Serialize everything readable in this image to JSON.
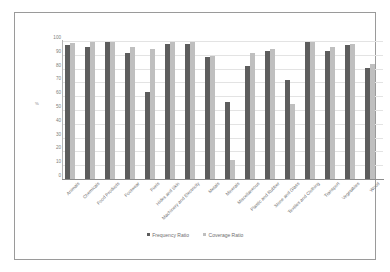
{
  "chart_data": {
    "type": "bar",
    "title": "",
    "xlabel": "",
    "ylabel": "%",
    "ylim": [
      0,
      100
    ],
    "yticks": [
      100,
      90,
      80,
      70,
      60,
      50,
      40,
      30,
      20,
      10,
      0
    ],
    "grid": true,
    "legend_position": "bottom",
    "categories": [
      "Animals",
      "Chemicals",
      "Food Products",
      "Footwear",
      "Fuels",
      "Hides and Skin",
      "Machinery and Electricity",
      "Metals",
      "Minerals",
      "Miscellaneous",
      "Plastic and Rubber",
      "Stone and Glass",
      "Textiles and Clothing",
      "Transport",
      "Vegetables",
      "Wood"
    ],
    "series": [
      {
        "name": "Frequency Ratio",
        "color": "#5d5d5d",
        "values": [
          97,
          96,
          99,
          91,
          63,
          98,
          98,
          88.5,
          56,
          82,
          93,
          71.5,
          99,
          92.5,
          97,
          80.5
        ]
      },
      {
        "name": "Coverage Ratio",
        "color": "#bfbfbf",
        "values": [
          98.5,
          99.5,
          99,
          96,
          94,
          99,
          99,
          89,
          14,
          91.5,
          94,
          54,
          99,
          96,
          98,
          83
        ]
      }
    ]
  }
}
